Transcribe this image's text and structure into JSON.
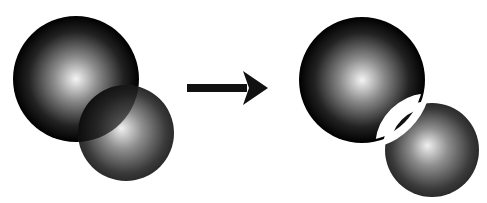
{
  "diagram": {
    "colors": {
      "background": "#ffffff",
      "sphere_dark": "#000000",
      "sphere_highlight": "#ffffff",
      "arrow": "#111111",
      "gap": "#ffffff"
    },
    "before": {
      "large_sphere": {
        "cx": 76,
        "cy": 79,
        "r": 63
      },
      "small_sphere": {
        "cx": 126,
        "cy": 133,
        "r": 48
      }
    },
    "arrow": {
      "x1": 187,
      "y1": 88,
      "x2": 268,
      "y2": 88
    },
    "after": {
      "large_sphere": {
        "cx": 362,
        "cy": 80,
        "r": 63
      },
      "small_sphere": {
        "cx": 432,
        "cy": 150,
        "r": 47
      },
      "lens_gap_width": 8
    }
  }
}
